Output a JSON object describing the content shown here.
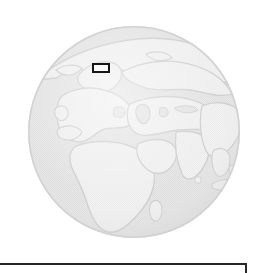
{
  "view": {
    "background_color": "#ffffff",
    "width": 266,
    "height": 271
  },
  "globe": {
    "label": "Eastern Hemisphere globe",
    "projection": "orthographic",
    "center_lon": 55,
    "center_lat": 25,
    "ocean_color": "#e3e3e3",
    "land_color": "#efefef",
    "outline_color": "#c9c9c9",
    "rim_color": "#d2d2d2",
    "cx": 108,
    "cy": 112,
    "r": 106,
    "regions": [
      "Europe",
      "Scandinavia",
      "Mediterranean Sea",
      "Africa",
      "Arabian Peninsula",
      "Caspian Sea",
      "Russia",
      "India",
      "Southeast Asia",
      "Indonesia",
      "Madagascar",
      "Sri Lanka",
      "British Isles"
    ]
  },
  "marker": {
    "label": "highlighted region marker",
    "shape": "rectangle",
    "border_color": "#161616",
    "fill_color": "#fbfbfb",
    "x": 92,
    "y": 63,
    "width": 18,
    "height": 10
  },
  "bottom_panel": {
    "label": "caption panel",
    "border_color": "#24262b",
    "fill_color": "#ffffff",
    "text": ""
  }
}
